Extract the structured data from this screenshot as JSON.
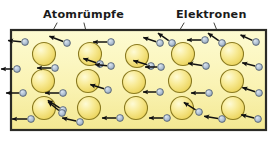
{
  "figure": {
    "background_color": "#ffffff",
    "box": {
      "fill_top_color": "#fdfbd0",
      "fill_bottom_color": "#f5eb96",
      "border_color": "#2b2b26",
      "x": 11,
      "y": 30,
      "width": 255,
      "height": 100
    }
  },
  "labels": [
    {
      "id": "label-atomruempfe",
      "text": "Atomrümpfe",
      "x": 43,
      "y": 18,
      "anchor": "start",
      "color": "#1b1b1b"
    },
    {
      "id": "label-elektronen",
      "text": "Elektronen",
      "x": 176,
      "y": 18,
      "anchor": "start",
      "color": "#1b1b1b"
    }
  ],
  "leader_lines": [
    {
      "id": "leader-atom-1",
      "x1": 57,
      "y1": 23,
      "x2": 44,
      "y2": 47
    },
    {
      "id": "leader-atom-2",
      "x1": 84,
      "y1": 23,
      "x2": 90,
      "y2": 47
    },
    {
      "id": "leader-electron-1",
      "x1": 184,
      "y1": 23,
      "x2": 172,
      "y2": 43
    },
    {
      "id": "leader-electron-2",
      "x1": 214,
      "y1": 23,
      "x2": 222,
      "y2": 43
    }
  ],
  "atom_cores": {
    "name": "atom-core",
    "radius": 11.5,
    "fill_light": "#fdf6b8",
    "fill_mid": "#f5e271",
    "fill_dark": "#e8cf4e",
    "stroke": "#8a7a20",
    "positions": [
      {
        "cx": 44,
        "cy": 54
      },
      {
        "cx": 90,
        "cy": 54
      },
      {
        "cx": 137,
        "cy": 56
      },
      {
        "cx": 183,
        "cy": 54
      },
      {
        "cx": 232,
        "cy": 54
      },
      {
        "cx": 43,
        "cy": 81
      },
      {
        "cx": 88,
        "cy": 81
      },
      {
        "cx": 134,
        "cy": 82
      },
      {
        "cx": 180,
        "cy": 81
      },
      {
        "cx": 232,
        "cy": 81
      },
      {
        "cx": 44,
        "cy": 108
      },
      {
        "cx": 89,
        "cy": 108
      },
      {
        "cx": 136,
        "cy": 108
      },
      {
        "cx": 182,
        "cy": 108
      },
      {
        "cx": 233,
        "cy": 108
      }
    ]
  },
  "electrons": {
    "name": "electron",
    "radius": 3.4,
    "fill_light": "#ccd8e6",
    "fill_dark": "#93a7bd",
    "stroke": "#4e5b6b",
    "arrow_color": "#111111",
    "items": [
      {
        "cx": 25,
        "cy": 42,
        "ax": -12,
        "ay": -1
      },
      {
        "cx": 17,
        "cy": 69,
        "ax": -11,
        "ay": 0
      },
      {
        "cx": 23,
        "cy": 93,
        "ax": -12,
        "ay": 0
      },
      {
        "cx": 31,
        "cy": 119,
        "ax": -14,
        "ay": 0
      },
      {
        "cx": 67,
        "cy": 43,
        "ax": -13,
        "ay": -5
      },
      {
        "cx": 55,
        "cy": 68,
        "ax": -13,
        "ay": 0
      },
      {
        "cx": 63,
        "cy": 93,
        "ax": -13,
        "ay": 0
      },
      {
        "cx": 63,
        "cy": 110,
        "ax": -11,
        "ay": -7
      },
      {
        "cx": 111,
        "cy": 42,
        "ax": -13,
        "ay": 0
      },
      {
        "cx": 100,
        "cy": 64,
        "ax": -12,
        "ay": -4
      },
      {
        "cx": 111,
        "cy": 66,
        "ax": -11,
        "ay": -1
      },
      {
        "cx": 108,
        "cy": 90,
        "ax": -13,
        "ay": -4
      },
      {
        "cx": 80,
        "cy": 122,
        "ax": -13,
        "ay": -3
      },
      {
        "cx": 160,
        "cy": 43,
        "ax": -12,
        "ay": -4
      },
      {
        "cx": 151,
        "cy": 66,
        "ax": -13,
        "ay": -4
      },
      {
        "cx": 161,
        "cy": 67,
        "ax": -11,
        "ay": 0
      },
      {
        "cx": 160,
        "cy": 92,
        "ax": -12,
        "ay": 0
      },
      {
        "cx": 120,
        "cy": 118,
        "ax": -13,
        "ay": 0
      },
      {
        "cx": 205,
        "cy": 40,
        "ax": -13,
        "ay": 0
      },
      {
        "cx": 206,
        "cy": 66,
        "ax": -13,
        "ay": -2
      },
      {
        "cx": 209,
        "cy": 93,
        "ax": -13,
        "ay": 0
      },
      {
        "cx": 167,
        "cy": 118,
        "ax": -13,
        "ay": 0
      },
      {
        "cx": 222,
        "cy": 119,
        "ax": -13,
        "ay": -2
      },
      {
        "cx": 172,
        "cy": 43,
        "ax": -10,
        "ay": -7
      },
      {
        "cx": 222,
        "cy": 43,
        "ax": -10,
        "ay": -7
      },
      {
        "cx": 256,
        "cy": 42,
        "ax": -11,
        "ay": -5
      },
      {
        "cx": 259,
        "cy": 67,
        "ax": -12,
        "ay": -3
      },
      {
        "cx": 259,
        "cy": 93,
        "ax": -12,
        "ay": -4
      },
      {
        "cx": 258,
        "cy": 119,
        "ax": -12,
        "ay": -3
      },
      {
        "cx": 199,
        "cy": 112,
        "ax": -11,
        "ay": -7
      },
      {
        "cx": 62,
        "cy": 113,
        "ax": -10,
        "ay": -8
      }
    ]
  }
}
